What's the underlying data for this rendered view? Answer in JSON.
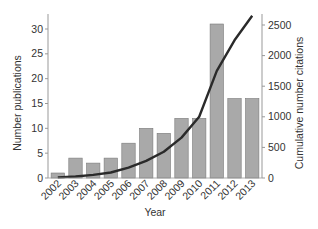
{
  "chart_data": {
    "type": "bar",
    "title": "",
    "xlabel": "Year",
    "ylabel": "Number publications",
    "y2label": "Cumulative number citations",
    "categories": [
      "2002",
      "2003",
      "2004",
      "2005",
      "2006",
      "2007",
      "2008",
      "2009",
      "2010",
      "2011",
      "2012",
      "2013"
    ],
    "series": [
      {
        "name": "Number publications",
        "type": "bar",
        "axis": "left",
        "color": "#a9a9a9",
        "values": [
          1,
          4,
          3,
          4,
          7,
          10,
          9,
          12,
          12,
          31,
          16,
          16
        ]
      },
      {
        "name": "Cumulative number citations",
        "type": "line",
        "axis": "right",
        "color": "#2a2a2a",
        "values": [
          10,
          25,
          50,
          90,
          170,
          280,
          430,
          660,
          1000,
          1750,
          2250,
          2650
        ]
      }
    ],
    "ylim": [
      0,
      33
    ],
    "y2lim": [
      0,
      2650
    ],
    "yticks": [
      0,
      5,
      10,
      15,
      20,
      25,
      30
    ],
    "y2ticks": [
      0,
      500,
      1000,
      1500,
      2000,
      2500
    ],
    "grid": false,
    "legend": "none"
  }
}
